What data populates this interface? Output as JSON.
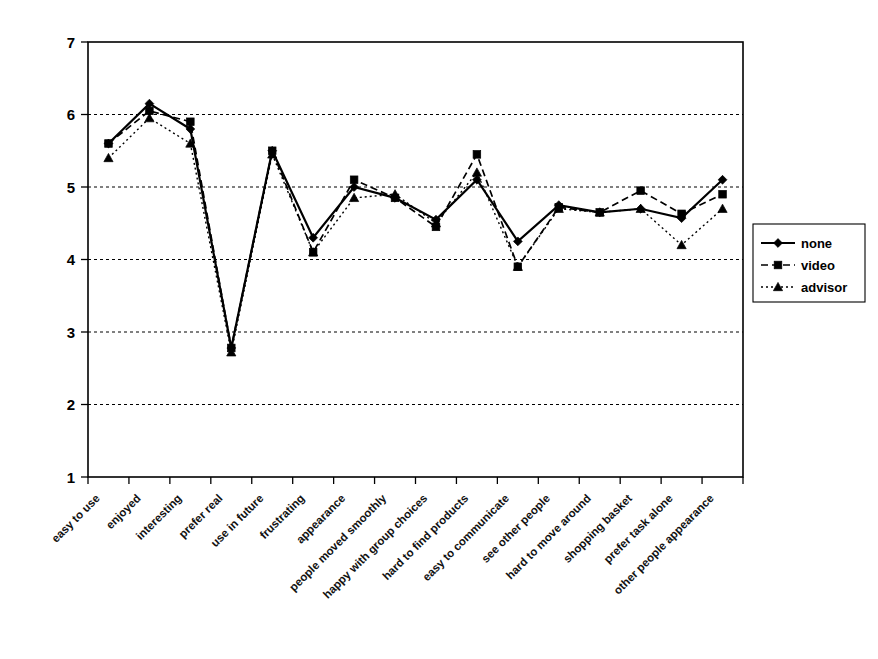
{
  "chart_data": {
    "type": "line",
    "title": "",
    "xlabel": "",
    "ylabel": "",
    "ylim": [
      1,
      7
    ],
    "yticks": [
      1,
      2,
      3,
      4,
      5,
      6,
      7
    ],
    "grid": true,
    "legend_position": "right-middle",
    "categories": [
      "easy to use",
      "enjoyed",
      "interesting",
      "prefer real",
      "use in future",
      "frustrating",
      "appearance",
      "people moved smoothly",
      "happy with group choices",
      "hard to find products",
      "easy to communicate",
      "see other people",
      "hard to move around",
      "shopping basket",
      "prefer task alone",
      "other people appearance"
    ],
    "series": [
      {
        "name": "none",
        "marker": "diamond",
        "line_style": "solid",
        "values": [
          5.6,
          6.15,
          5.8,
          2.78,
          5.5,
          4.3,
          5.0,
          4.85,
          4.55,
          5.1,
          4.25,
          4.75,
          4.65,
          4.7,
          4.57,
          5.1
        ]
      },
      {
        "name": "video",
        "marker": "square",
        "line_style": "dashed",
        "values": [
          5.6,
          6.05,
          5.9,
          2.78,
          5.5,
          4.1,
          5.1,
          4.85,
          4.45,
          5.45,
          3.9,
          4.72,
          4.65,
          4.95,
          4.63,
          4.9
        ]
      },
      {
        "name": "advisor",
        "marker": "triangle",
        "line_style": "dotted",
        "values": [
          5.4,
          5.95,
          5.6,
          2.72,
          5.45,
          4.1,
          4.85,
          4.9,
          4.5,
          5.2,
          3.9,
          4.7,
          4.65,
          4.7,
          4.2,
          4.7
        ]
      }
    ]
  },
  "legend": {
    "entries": [
      {
        "label": "none"
      },
      {
        "label": "video"
      },
      {
        "label": "advisor"
      }
    ]
  },
  "colors": {
    "series": "#000000",
    "grid": "#000000",
    "axis": "#000000",
    "background": "#ffffff"
  }
}
